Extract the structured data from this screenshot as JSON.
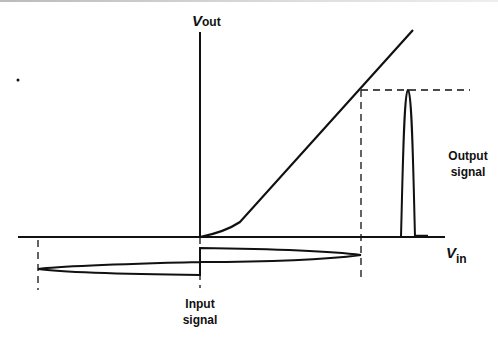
{
  "diagram": {
    "labels": {
      "y_axis": {
        "main": "V",
        "sub": "out"
      },
      "x_axis": {
        "main": "V",
        "sub": "in"
      },
      "output_signal": {
        "line1": "Output",
        "line2": "signal"
      },
      "input_signal": {
        "line1": "Input",
        "line2": "signal"
      }
    },
    "colors": {
      "stroke": "#111111",
      "background": "#ffffff"
    }
  }
}
